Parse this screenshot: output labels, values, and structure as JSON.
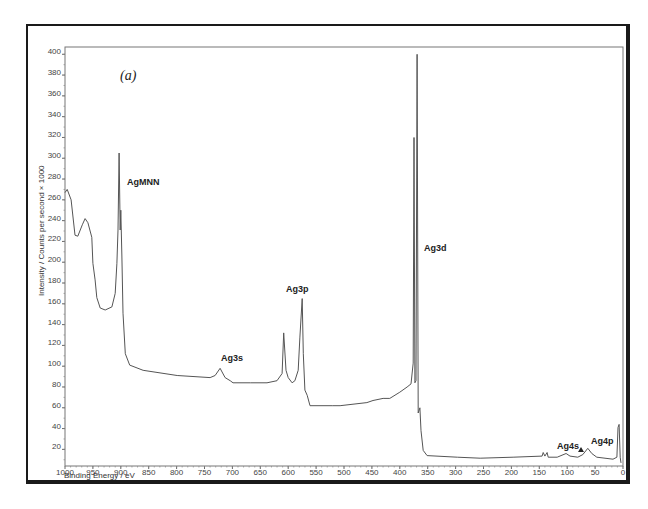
{
  "chart_data": {
    "type": "line",
    "title": "",
    "panel_label": "(a)",
    "xlabel": "Binding Energy / eV",
    "ylabel": "Intensity / Counts per second × 1000",
    "xlim": [
      1000,
      0
    ],
    "ylim": [
      4,
      407
    ],
    "x_reversed": true,
    "grid": false,
    "legend": "none",
    "x_ticks": [
      1000,
      950,
      900,
      850,
      800,
      750,
      700,
      650,
      600,
      550,
      500,
      450,
      400,
      350,
      300,
      250,
      200,
      150,
      100,
      50,
      0
    ],
    "y_ticks": [
      20,
      40,
      60,
      80,
      100,
      120,
      140,
      160,
      180,
      200,
      220,
      240,
      260,
      280,
      300,
      320,
      340,
      360,
      380,
      400
    ],
    "series": [
      {
        "name": "XPS survey spectrum",
        "color": "#555555",
        "x": [
          1000,
          996,
          989,
          982,
          977,
          969,
          964,
          959,
          952,
          950,
          946,
          943,
          937,
          928,
          916,
          910,
          907,
          905,
          903,
          901,
          900,
          898,
          896,
          892,
          884,
          860,
          799,
          740,
          731,
          722,
          713,
          704,
          699,
          668,
          638,
          620,
          611,
          608,
          604,
          600,
          593,
          588,
          582,
          579,
          575,
          573,
          570,
          566,
          561,
          520,
          507,
          459,
          448,
          430,
          418,
          400,
          387,
          380,
          376,
          374.5,
          373,
          371,
          369,
          367,
          364,
          362,
          358,
          351,
          297,
          256,
          197,
          145,
          143,
          140,
          136,
          134,
          118,
          102,
          95,
          81,
          72,
          63,
          56,
          47,
          18,
          11,
          9,
          7,
          5,
          3.5
        ],
        "y": [
          267,
          270,
          260,
          226,
          225,
          236,
          242,
          238,
          224,
          199,
          183,
          166,
          156,
          154,
          157,
          170,
          199,
          231,
          305,
          231,
          250,
          205,
          151,
          112,
          101,
          96,
          91,
          89,
          91,
          98,
          89,
          86,
          84,
          84,
          84,
          86,
          93,
          132,
          96,
          89,
          84,
          86,
          96,
          128,
          165,
          112,
          77,
          72,
          62,
          62,
          62,
          65,
          67,
          69,
          69,
          75,
          80,
          83,
          103,
          320,
          84,
          86,
          400,
          55,
          60,
          38,
          19,
          14,
          12.5,
          11.5,
          12.5,
          13.5,
          17,
          13.5,
          17,
          12.5,
          12.5,
          16,
          13.5,
          12.5,
          15,
          21,
          16,
          12.5,
          10.5,
          12.5,
          41,
          44,
          12.5,
          7
        ]
      }
    ],
    "annotations": [
      {
        "text": "AgMNN",
        "x": 903,
        "y": 305
      },
      {
        "text": "Ag3s",
        "x": 722,
        "y": 98
      },
      {
        "text": "Ag3p",
        "x": 575,
        "y": 165
      },
      {
        "text": "Ag3d",
        "x": 368,
        "y": 400
      },
      {
        "text": "Ag4s",
        "x": 96,
        "y": 16
      },
      {
        "text": "Ag4p",
        "x": 58,
        "y": 21
      }
    ]
  }
}
